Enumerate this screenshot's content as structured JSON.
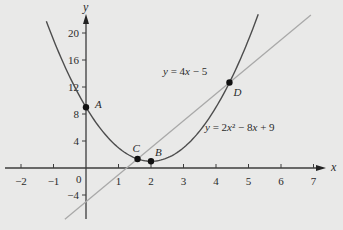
{
  "chart_data": {
    "type": "line",
    "title": "",
    "xlabel": "x",
    "ylabel": "y",
    "xlim": [
      -2.2,
      7.4
    ],
    "ylim": [
      -7.6,
      23.5
    ],
    "grid": false,
    "x_ticks": [
      -2,
      -1,
      1,
      2,
      3,
      4,
      5,
      6,
      7
    ],
    "x_tick_labels": [
      "-2",
      "-1",
      "1",
      "2",
      "3",
      "4",
      "5",
      "6",
      "7"
    ],
    "y_ticks": [
      -4,
      4,
      8,
      12,
      16,
      20
    ],
    "y_tick_labels": [
      "-4",
      "4",
      "8",
      "12",
      "16",
      "20"
    ],
    "origin_label": "0",
    "series": [
      {
        "name": "y = 2x² − 8x + 9",
        "kind": "parabola",
        "equation": {
          "a": 2,
          "b": -8,
          "c": 9
        },
        "x_range": [
          -1.22,
          5.3
        ],
        "color": "#4d4d4d",
        "label_text": "y = 2x² − 8x + 9",
        "label_pos": [
          205,
          131
        ]
      },
      {
        "name": "y = 4x − 5",
        "kind": "line",
        "equation": {
          "m": 4,
          "b": -5
        },
        "x_range": [
          -0.65,
          6.92
        ],
        "color": "#a9a9a9",
        "label_text": "y = 4x − 5",
        "label_pos": [
          163,
          75
        ]
      }
    ],
    "points": [
      {
        "label": "A",
        "x": 0,
        "y": 9,
        "label_offset": [
          9,
          1
        ]
      },
      {
        "label": "B",
        "x": 2,
        "y": 1,
        "label_offset": [
          4,
          -5
        ]
      },
      {
        "label": "C",
        "x": 1.586,
        "y": 1.343,
        "label_offset": [
          -5,
          -7
        ]
      },
      {
        "label": "D",
        "x": 4.414,
        "y": 12.657,
        "label_offset": [
          4,
          13
        ]
      }
    ],
    "annotations": [
      "A",
      "B",
      "C",
      "D",
      "y = 4x − 5",
      "y = 2x² − 8x + 9"
    ]
  },
  "layout": {
    "origin_px": [
      86,
      168
    ],
    "px_per_x": 32.5,
    "px_per_y": 6.75,
    "x_axis_px": [
      5,
      326
    ],
    "y_axis_px": [
      219,
      14
    ],
    "colors": {
      "background": "#e9e9e8",
      "axis": "#3c3c3c",
      "point": "#111111",
      "text": "#2b2b2b"
    }
  }
}
